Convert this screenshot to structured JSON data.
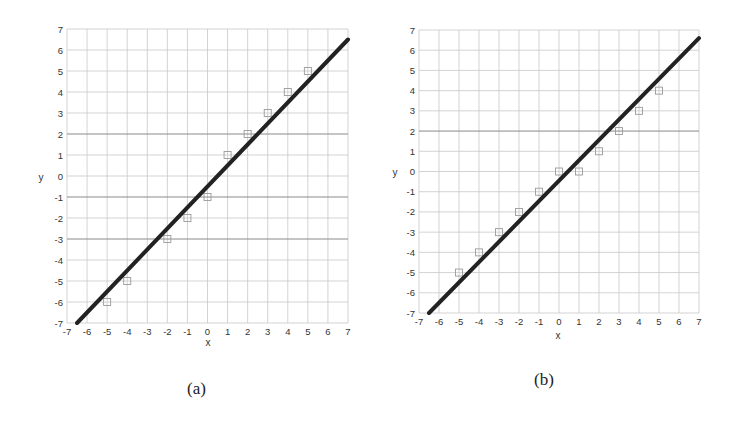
{
  "figure": {
    "panels": [
      {
        "caption": "(a)"
      },
      {
        "caption": "(b)"
      }
    ]
  },
  "chart_data": [
    {
      "type": "scatter",
      "panel": "(a)",
      "title": "",
      "xlabel": "x",
      "ylabel": "y",
      "xlim": [
        -7,
        7
      ],
      "ylim": [
        -7,
        7
      ],
      "grid": true,
      "xticks": [
        -7,
        -6,
        -5,
        -4,
        -3,
        -2,
        -1,
        0,
        1,
        2,
        3,
        4,
        5,
        6,
        7
      ],
      "yticks": [
        -7,
        -6,
        -5,
        -4,
        -3,
        -2,
        -1,
        0,
        1,
        2,
        3,
        4,
        5,
        6,
        7
      ],
      "series": [
        {
          "name": "data points",
          "marker": "square",
          "x": [
            -5,
            -4,
            -2,
            -1,
            0,
            1,
            2,
            3,
            4,
            5
          ],
          "y": [
            -6,
            -5,
            -3,
            -2,
            -1,
            1,
            2,
            3,
            4,
            5
          ]
        },
        {
          "name": "fitted line",
          "type": "line",
          "x": [
            -6.5,
            7
          ],
          "y": [
            -7,
            6.5
          ]
        }
      ]
    },
    {
      "type": "scatter",
      "panel": "(b)",
      "title": "",
      "xlabel": "x",
      "ylabel": "y",
      "xlim": [
        -7,
        7
      ],
      "ylim": [
        -7,
        7
      ],
      "grid": true,
      "xticks": [
        -7,
        -6,
        -5,
        -4,
        -3,
        -2,
        -1,
        0,
        1,
        2,
        3,
        4,
        5,
        6,
        7
      ],
      "yticks": [
        -7,
        -6,
        -5,
        -4,
        -3,
        -2,
        -1,
        0,
        1,
        2,
        3,
        4,
        5,
        6,
        7
      ],
      "series": [
        {
          "name": "data points",
          "marker": "square",
          "x": [
            -5,
            -4,
            -3,
            -2,
            -1,
            0,
            1,
            2,
            3,
            4,
            5
          ],
          "y": [
            -5,
            -4,
            -3,
            -2,
            -1,
            0,
            0,
            1,
            2,
            3,
            4
          ]
        },
        {
          "name": "fitted line",
          "type": "line",
          "x": [
            -6.5,
            7
          ],
          "y": [
            -7,
            6.6
          ]
        }
      ]
    }
  ],
  "style": {
    "grid_color": "#c8c8c8",
    "grid_dark_color": "#8a8a8a",
    "line_color": "#222222",
    "marker_color": "#9a9a9a"
  },
  "layout": [
    {
      "plot": {
        "left": 67,
        "top": 29,
        "right": 348,
        "bottom": 323
      },
      "dark_grid_y": [
        2,
        -1,
        -3
      ],
      "ylabel_pos": [
        41,
        181
      ],
      "xlabel_pos": [
        208,
        346
      ],
      "caption_pos": [
        187,
        379
      ]
    },
    {
      "plot": {
        "left": 51,
        "top": 30,
        "right": 331,
        "bottom": 313
      },
      "dark_grid_y": [
        2
      ],
      "ylabel_pos": [
        27,
        176
      ],
      "xlabel_pos": [
        190,
        339
      ],
      "caption_pos": [
        166,
        370
      ]
    }
  ]
}
